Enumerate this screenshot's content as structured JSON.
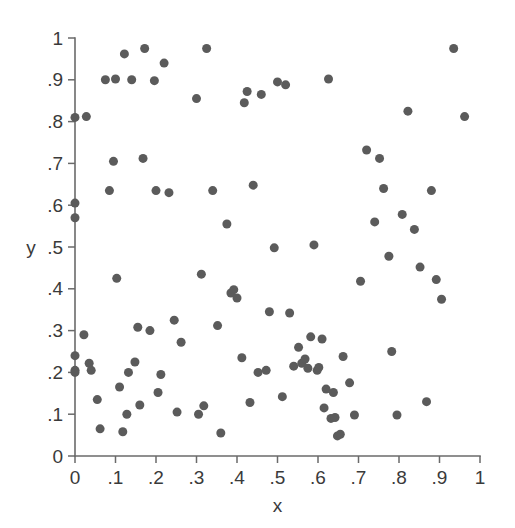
{
  "chart_data": {
    "type": "scatter",
    "title": "",
    "subtitle": "",
    "xlabel": "x",
    "ylabel": "y",
    "xlim": [
      0,
      1
    ],
    "ylim": [
      0,
      1
    ],
    "grid": false,
    "legend": null,
    "marker": {
      "shape": "circle",
      "color": "#5b5b5b",
      "size_px": 9
    },
    "axis_color": "#6a6a6a",
    "background_color": "#ffffff",
    "xticks": [
      0,
      0.1,
      0.2,
      0.3,
      0.4,
      0.5,
      0.6,
      0.7,
      0.8,
      0.9,
      1
    ],
    "xticklabels": [
      "0",
      ".1",
      ".2",
      ".3",
      ".4",
      ".5",
      ".6",
      ".7",
      ".8",
      ".9",
      "1"
    ],
    "yticks": [
      0,
      0.1,
      0.2,
      0.3,
      0.4,
      0.5,
      0.6,
      0.7,
      0.8,
      0.9,
      1
    ],
    "yticklabels": [
      "0",
      ".1",
      ".2",
      ".3",
      ".4",
      ".5",
      ".6",
      ".7",
      ".8",
      ".9",
      "1"
    ],
    "n_points": 103,
    "series": [
      {
        "name": "points",
        "x": [
          0.0,
          0.0,
          0.0,
          0.0,
          0.0,
          0.0,
          0.022,
          0.028,
          0.035,
          0.04,
          0.055,
          0.062,
          0.075,
          0.085,
          0.095,
          0.1,
          0.103,
          0.11,
          0.118,
          0.122,
          0.128,
          0.132,
          0.14,
          0.148,
          0.155,
          0.16,
          0.168,
          0.172,
          0.185,
          0.196,
          0.2,
          0.205,
          0.212,
          0.22,
          0.232,
          0.245,
          0.252,
          0.262,
          0.3,
          0.305,
          0.312,
          0.318,
          0.325,
          0.34,
          0.352,
          0.36,
          0.375,
          0.385,
          0.392,
          0.4,
          0.412,
          0.418,
          0.425,
          0.432,
          0.44,
          0.452,
          0.46,
          0.472,
          0.48,
          0.492,
          0.5,
          0.512,
          0.52,
          0.53,
          0.54,
          0.552,
          0.56,
          0.568,
          0.575,
          0.582,
          0.59,
          0.598,
          0.602,
          0.61,
          0.615,
          0.62,
          0.626,
          0.632,
          0.638,
          0.642,
          0.648,
          0.655,
          0.662,
          0.678,
          0.69,
          0.705,
          0.72,
          0.74,
          0.752,
          0.762,
          0.775,
          0.782,
          0.795,
          0.808,
          0.822,
          0.838,
          0.852,
          0.868,
          0.88,
          0.892,
          0.905,
          0.935,
          0.962
        ],
        "y": [
          0.81,
          0.605,
          0.57,
          0.24,
          0.205,
          0.2,
          0.29,
          0.812,
          0.222,
          0.205,
          0.135,
          0.065,
          0.9,
          0.635,
          0.705,
          0.902,
          0.425,
          0.165,
          0.058,
          0.962,
          0.1,
          0.2,
          0.9,
          0.225,
          0.308,
          0.122,
          0.712,
          0.975,
          0.3,
          0.898,
          0.635,
          0.152,
          0.195,
          0.94,
          0.63,
          0.325,
          0.105,
          0.272,
          0.855,
          0.1,
          0.435,
          0.12,
          0.975,
          0.635,
          0.312,
          0.055,
          0.555,
          0.39,
          0.398,
          0.378,
          0.235,
          0.845,
          0.872,
          0.128,
          0.648,
          0.2,
          0.865,
          0.205,
          0.345,
          0.498,
          0.895,
          0.142,
          0.888,
          0.342,
          0.215,
          0.26,
          0.222,
          0.232,
          0.21,
          0.285,
          0.505,
          0.205,
          0.212,
          0.28,
          0.115,
          0.16,
          0.902,
          0.09,
          0.152,
          0.092,
          0.048,
          0.052,
          0.238,
          0.175,
          0.098,
          0.418,
          0.732,
          0.56,
          0.712,
          0.64,
          0.478,
          0.25,
          0.098,
          0.578,
          0.825,
          0.542,
          0.452,
          0.13,
          0.635,
          0.422,
          0.375,
          0.975,
          0.812
        ]
      }
    ]
  }
}
